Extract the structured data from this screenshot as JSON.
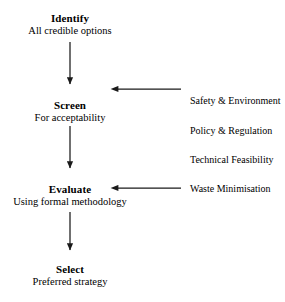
{
  "diagram": {
    "background_color": "#ffffff",
    "line_color": "#1a1a1a",
    "text_color": "#000000",
    "nodes": [
      {
        "id": "identify",
        "title": "Identify",
        "subtitle": "All credible options",
        "x": 70,
        "y": 12
      },
      {
        "id": "screen",
        "title": "Screen",
        "subtitle": "For acceptability",
        "x": 70,
        "y": 99
      },
      {
        "id": "evaluate",
        "title": "Evaluate",
        "subtitle": "Using formal methodology",
        "x": 70,
        "y": 183
      },
      {
        "id": "select",
        "title": "Select",
        "subtitle": "Preferred strategy",
        "x": 70,
        "y": 263
      }
    ],
    "criteria": [
      {
        "id": "safety-environment",
        "label": "Safety & Environment",
        "x": 190,
        "y": 96
      },
      {
        "id": "policy-regulation",
        "label": "Policy & Regulation",
        "x": 190,
        "y": 126
      },
      {
        "id": "technical-feasibility",
        "label": "Technical Feasibility",
        "x": 190,
        "y": 155
      },
      {
        "id": "waste-minimisation",
        "label": "Waste Minimisation",
        "x": 190,
        "y": 184
      }
    ],
    "connectors": [
      {
        "id": "identify-to-screen",
        "from": "identify",
        "to": "screen",
        "direction": "down",
        "x": 70,
        "y1": 42,
        "y2": 92
      },
      {
        "id": "screen-to-evaluate",
        "from": "screen",
        "to": "evaluate",
        "direction": "down",
        "x": 70,
        "y1": 126,
        "y2": 176
      },
      {
        "id": "evaluate-to-select",
        "from": "evaluate",
        "to": "select",
        "direction": "down",
        "x": 70,
        "y1": 212,
        "y2": 258
      },
      {
        "id": "criteria-to-screen",
        "from": "criteria-group",
        "to": "screen",
        "direction": "left",
        "y": 89,
        "x1": 181,
        "x2": 110
      },
      {
        "id": "criteria-to-evaluate",
        "from": "criteria-group",
        "to": "evaluate",
        "direction": "left",
        "y": 188,
        "x1": 181,
        "x2": 110
      }
    ]
  }
}
